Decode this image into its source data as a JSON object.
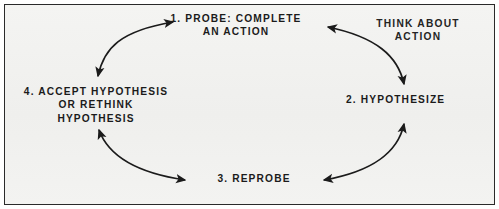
{
  "diagram": {
    "title_present": false,
    "type": "cycle",
    "background_color": "#f2f2f0",
    "border_color": "#2a2a2a",
    "text_color": "#1b1b1b",
    "arrow_color": "#1b1b1b",
    "nodes": [
      {
        "id": "probe",
        "label": "1. PROBE: COMPLETE\nAN ACTION"
      },
      {
        "id": "think",
        "label": "THINK ABOUT\nACTION"
      },
      {
        "id": "hypo",
        "label": "2. HYPOTHESIZE"
      },
      {
        "id": "accept",
        "label": "4. ACCEPT HYPOTHESIS\nOR RETHINK\nHYPOTHESIS"
      },
      {
        "id": "reprobe",
        "label": "3. REPROBE"
      }
    ],
    "connections": [
      {
        "id": "accept-probe",
        "from": "accept",
        "to": "probe",
        "style": "double-headed-arc"
      },
      {
        "id": "probe-hypo",
        "from": "probe",
        "to": "hypo",
        "style": "double-headed-arc"
      },
      {
        "id": "hypo-reprobe",
        "from": "hypo",
        "to": "reprobe",
        "style": "double-headed-arc"
      },
      {
        "id": "reprobe-accept",
        "from": "reprobe",
        "to": "accept",
        "style": "double-headed-arc"
      }
    ]
  }
}
